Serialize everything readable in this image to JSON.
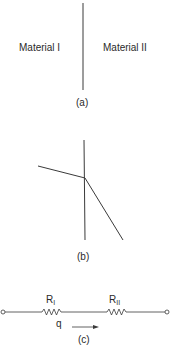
{
  "panel_a": {
    "left_label": "Material I",
    "right_label": "Material II",
    "caption": "(a)"
  },
  "panel_b": {
    "caption": "(b)"
  },
  "panel_c": {
    "resistor_1": {
      "symbol": "R",
      "subscript": "I"
    },
    "resistor_2": {
      "symbol": "R",
      "subscript": "II"
    },
    "flow_label": "q",
    "caption": "(c)"
  },
  "colors": {
    "line": "#3a3a3a",
    "background": "#ffffff"
  }
}
